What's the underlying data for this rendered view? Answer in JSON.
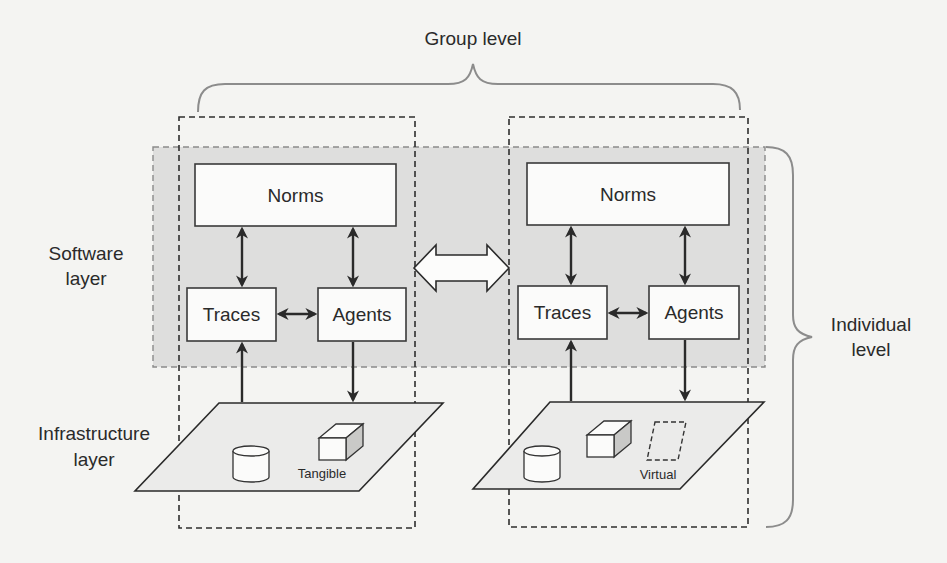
{
  "diagram": {
    "group_level_label": "Group level",
    "individual_level_label": [
      "Individual",
      "level"
    ],
    "software_layer_label": [
      "Software",
      "layer"
    ],
    "infrastructure_layer_label": [
      "Infrastructure",
      "layer"
    ],
    "left_group": {
      "norms": "Norms",
      "traces": "Traces",
      "agents": "Agents",
      "infrastructure_tag": "Tangible"
    },
    "right_group": {
      "norms": "Norms",
      "traces": "Traces",
      "agents": "Agents",
      "infrastructure_tag": "Virtual"
    },
    "icons": {
      "database": "cylinder-icon",
      "tangible_resource": "cube-icon",
      "virtual_resource": "dashed-parallelogram-icon",
      "inter_group_link": "double-arrow-icon"
    },
    "colors": {
      "background": "#f4f4f2",
      "software_band": "#d7d7d5",
      "stroke": "#2a2a2a",
      "brace": "#8c8c8c"
    }
  }
}
